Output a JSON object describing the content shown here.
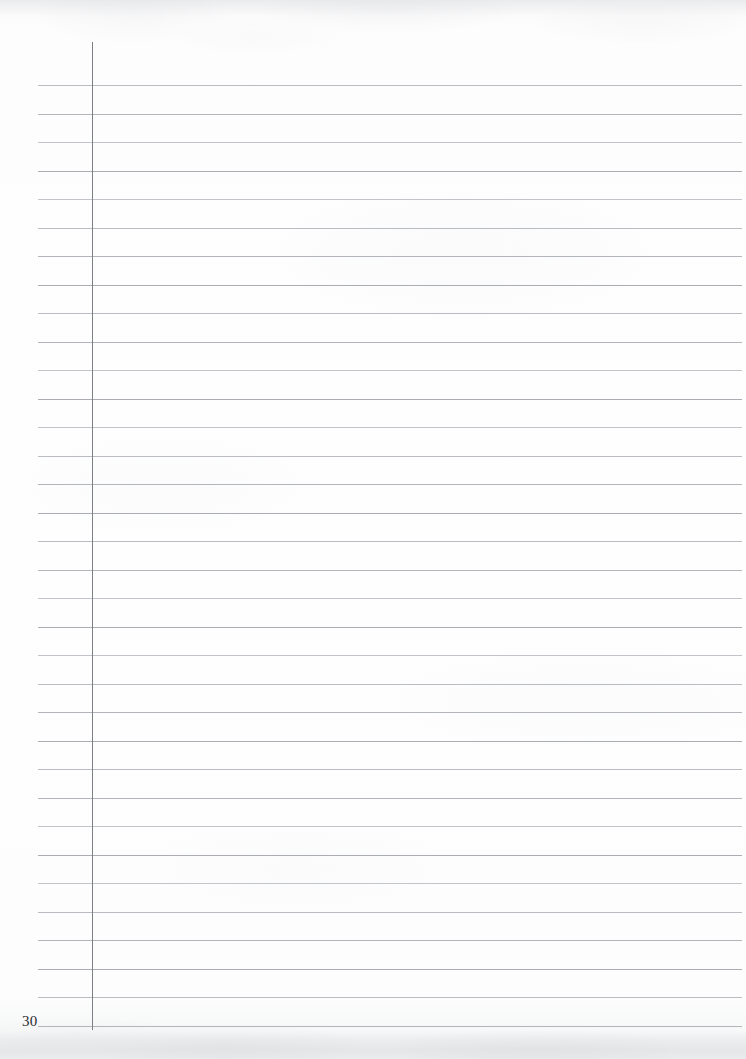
{
  "document": {
    "type": "scanned-ruled-notebook-page",
    "page_label": "30",
    "content_text": "",
    "is_blank": true
  },
  "page": {
    "width": 746,
    "height": 1059,
    "paper_color": "#fdfdfd",
    "background_color": "#ffffff"
  },
  "ruling": {
    "rule_color": "#b9bdc1",
    "rule_thickness": 1,
    "rule_left": 38,
    "rule_right": 742,
    "first_rule_y": 85,
    "line_spacing": 28.5,
    "rule_count": 34,
    "margin_line_color": "#7c7f84",
    "margin_line_x": 92,
    "margin_line_top": 42,
    "margin_line_bottom": 1030,
    "margin_line_thickness": 1
  },
  "page_number": {
    "value": "30",
    "x": 22,
    "y": 1014,
    "font_size": 15,
    "color": "#2c2c2e"
  },
  "writing_area": {
    "label": "blank writing area",
    "left": 92,
    "top": 85,
    "right": 742,
    "bottom": 1030,
    "text": ""
  }
}
